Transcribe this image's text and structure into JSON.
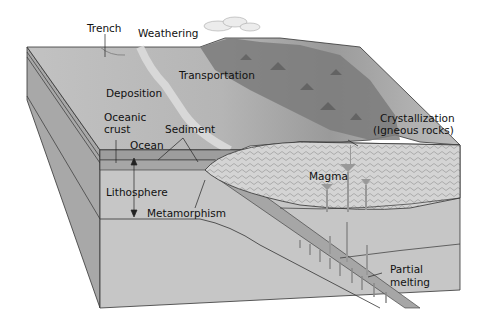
{
  "diagram": {
    "type": "block diagram",
    "labels": {
      "trench": "Trench",
      "weathering": "Weathering",
      "transportation": "Transportation",
      "deposition": "Deposition",
      "oceanic_crust_line1": "Oceanic",
      "oceanic_crust_line2": "crust",
      "sediment": "Sediment",
      "ocean": "Ocean",
      "lithosphere": "Lithosphere",
      "metamorphism": "Metamorphism",
      "crystallization_line1": "Crystallization",
      "crystallization_line2": "(Igneous rocks)",
      "magma": "Magma",
      "partial_melting_line1": "Partial",
      "partial_melting_line2": "melting"
    },
    "colors": {
      "background": "#ffffff",
      "side_face": "#a9a9a9",
      "front_face": "#c8c8c8",
      "top_surface": "#b7b7b7",
      "ocean": "#9e9e9e",
      "crust": "#b2b2b2",
      "magma": "#d2d2d2",
      "mountains": "#7a7a7a",
      "outline": "#333333"
    }
  }
}
